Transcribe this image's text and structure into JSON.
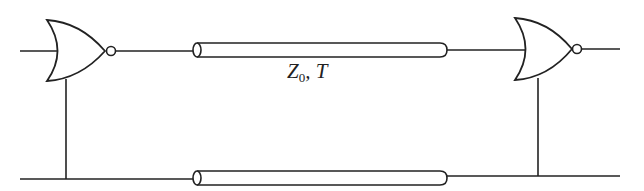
{
  "diagram": {
    "components": {
      "gate_left": {
        "type": "NOR gate"
      },
      "gate_right": {
        "type": "NOR gate"
      },
      "line_top": {
        "type": "transmission line"
      },
      "line_bottom": {
        "type": "transmission line"
      }
    },
    "label": {
      "main": "Z",
      "subscript": "0",
      "suffix": ", T"
    }
  }
}
